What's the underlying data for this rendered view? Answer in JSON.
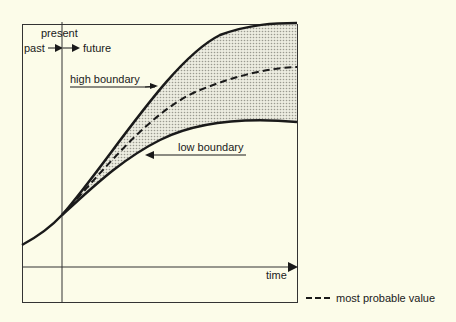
{
  "diagram": {
    "labels": {
      "present": "present",
      "past": "past",
      "future": "future",
      "high_boundary": "high boundary",
      "low_boundary": "low boundary",
      "time_axis": "time"
    },
    "legend": {
      "most_probable": "most probable value"
    },
    "colors": {
      "background": "#fcfce9",
      "line": "#1a1a1a",
      "cone_fill": "#d6d6cc"
    }
  }
}
